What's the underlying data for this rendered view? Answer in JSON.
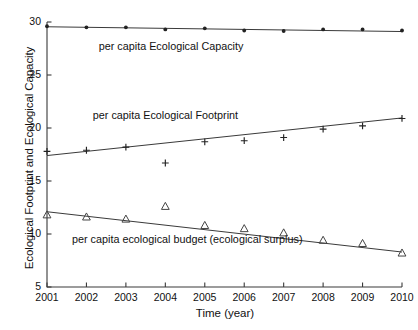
{
  "chart_data": {
    "type": "scatter",
    "title": "",
    "xlabel": "Time (year)",
    "ylabel": "Ecological Footprint and Ecological Capacity",
    "x": [
      2001,
      2002,
      2003,
      2004,
      2005,
      2006,
      2007,
      2008,
      2009,
      2010
    ],
    "xtick_labels": [
      "2001",
      "2002",
      "2003",
      "2004",
      "2005",
      "2006",
      "2007",
      "2008",
      "2009",
      "2010"
    ],
    "ytick_labels": [
      "5",
      "10",
      "15",
      "20",
      "25",
      "30"
    ],
    "yticks": [
      5,
      10,
      15,
      20,
      25,
      30
    ],
    "xlim": [
      2001,
      2010
    ],
    "ylim": [
      5,
      30
    ],
    "grid": false,
    "legend_position": "inline-annotations",
    "series": [
      {
        "name": "per capita Ecological Capacity",
        "marker": "dot",
        "values": [
          29.6,
          29.5,
          29.5,
          29.3,
          29.4,
          29.2,
          29.15,
          29.3,
          29.3,
          29.2
        ],
        "trend_start": 29.55,
        "trend_end": 29.1
      },
      {
        "name": "per capita Ecological Footprint",
        "marker": "plus",
        "values": [
          17.8,
          17.9,
          18.2,
          16.7,
          18.7,
          18.8,
          19.1,
          19.9,
          20.2,
          20.9
        ],
        "trend_start": 17.4,
        "trend_end": 20.95
      },
      {
        "name": "per capita ecological budget (ecological surplus)",
        "marker": "triangle-open",
        "values": [
          11.8,
          11.6,
          11.4,
          12.6,
          10.8,
          10.5,
          10.1,
          9.4,
          9.1,
          8.2
        ],
        "trend_start": 12.1,
        "trend_end": 8.3
      }
    ],
    "annotations": [
      {
        "text": "per capita Ecological Capacity",
        "x": 2004.15,
        "y": 27.6
      },
      {
        "text": "per capita Ecological Footprint",
        "x": 2004.0,
        "y": 21.1
      },
      {
        "text": "per capita ecological budget (ecological surplus)",
        "x": 2004.55,
        "y": 9.45
      }
    ]
  }
}
